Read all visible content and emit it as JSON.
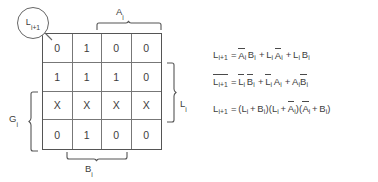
{
  "diagram": {
    "type": "karnaugh-map",
    "callout": {
      "label": "L",
      "sub": "i+1"
    },
    "kmap": {
      "rows": [
        [
          "0",
          "1",
          "0",
          "0"
        ],
        [
          "1",
          "1",
          "1",
          "0"
        ],
        [
          "X",
          "X",
          "X",
          "X"
        ],
        [
          "0",
          "1",
          "0",
          "0"
        ]
      ],
      "columns": 4,
      "row_count": 4
    },
    "brackets": {
      "top": {
        "label": "A",
        "sub": "i",
        "spans": "columns 3-4"
      },
      "bottom": {
        "label": "B",
        "sub": "i",
        "spans": "columns 2-3"
      },
      "right": {
        "label": "L",
        "sub": "i",
        "spans": "rows 2-3"
      },
      "left": {
        "label": "G",
        "sub": "i",
        "spans": "rows 3-4"
      }
    }
  },
  "equations": [
    {
      "id": "sum-of-products",
      "text": "L(i+1) = A̅(i)B(i) + L(i)A̅(i) + L(i)B(i)"
    },
    {
      "id": "complement-sum-of-products",
      "text": "L̅(i+1) = L̅(i)B̅(i) + L̅(i)A(i) + A(i)B̅(i)"
    },
    {
      "id": "product-of-sums",
      "text": "L(i+1) = (L(i) + B(i))(L(i) + A̅(i))(A̅(i) + B(i))"
    }
  ],
  "colors": {
    "background": "#ffffff",
    "ink": "#3d3d3d",
    "grid_outer": "#555555",
    "grid_inner": "#777777"
  }
}
